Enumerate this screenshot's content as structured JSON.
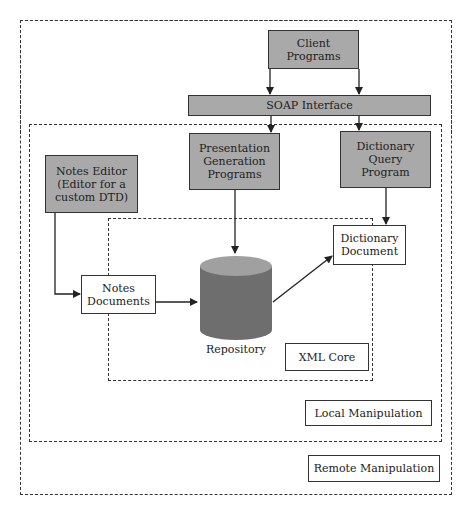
{
  "diagram": {
    "regions": {
      "remote": "Remote Manipulation",
      "local": "Local Manipulation",
      "core": "XML Core"
    },
    "nodes": {
      "client_programs": "Client\nPrograms",
      "soap_interface": "SOAP Interface",
      "presentation_programs": "Presentation\nGeneration\nPrograms",
      "dictionary_query": "Dictionary\nQuery\nProgram",
      "notes_editor": "Notes Editor\n(Editor for a\ncustom DTD)",
      "notes_documents": "Notes\nDocuments",
      "dictionary_document": "Dictionary\nDocument",
      "repository": "Repository"
    },
    "edges": [
      [
        "client_programs",
        "soap_interface"
      ],
      [
        "client_programs",
        "soap_interface"
      ],
      [
        "soap_interface",
        "presentation_programs"
      ],
      [
        "soap_interface",
        "dictionary_query"
      ],
      [
        "presentation_programs",
        "repository"
      ],
      [
        "dictionary_query",
        "dictionary_document"
      ],
      [
        "notes_editor",
        "notes_documents"
      ],
      [
        "notes_documents",
        "repository"
      ],
      [
        "repository",
        "dictionary_document"
      ]
    ],
    "colors": {
      "program_fill": "#a9a9a9",
      "cylinder_body": "#6e6e6e",
      "cylinder_top": "#a0a0a0"
    }
  }
}
